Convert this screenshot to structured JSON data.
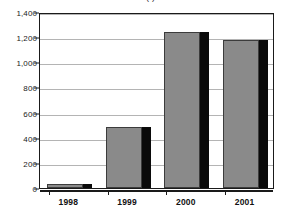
{
  "chart_data": {
    "type": "bar",
    "title": "",
    "title_remnant": "(   )",
    "xlabel": "",
    "ylabel": "",
    "categories": [
      "1998",
      "1999",
      "2000",
      "2001"
    ],
    "values": [
      35,
      485,
      1240,
      1175
    ],
    "series": [
      {
        "name": "",
        "values": [
          35,
          485,
          1240,
          1175
        ]
      }
    ],
    "ylim": [
      0,
      1400
    ],
    "ytick_values": [
      0,
      200,
      400,
      600,
      800,
      1000,
      1200,
      1400
    ],
    "ytick_labels": [
      "0",
      "200",
      "400",
      "600",
      "800",
      "1,000",
      "1,200",
      "1,400"
    ],
    "grid": true,
    "grid_axis": "y",
    "legend": false,
    "legend_position": "none",
    "annotations": [],
    "colors": {
      "bar_fill": "#8a8a8a",
      "bar_shadow": "#0a0a0a",
      "bar_outline": "#3c3c3c",
      "gridline": "#b4b4b4",
      "axis": "#1a1a1a",
      "background": "#ffffff",
      "text": "#111111"
    }
  }
}
